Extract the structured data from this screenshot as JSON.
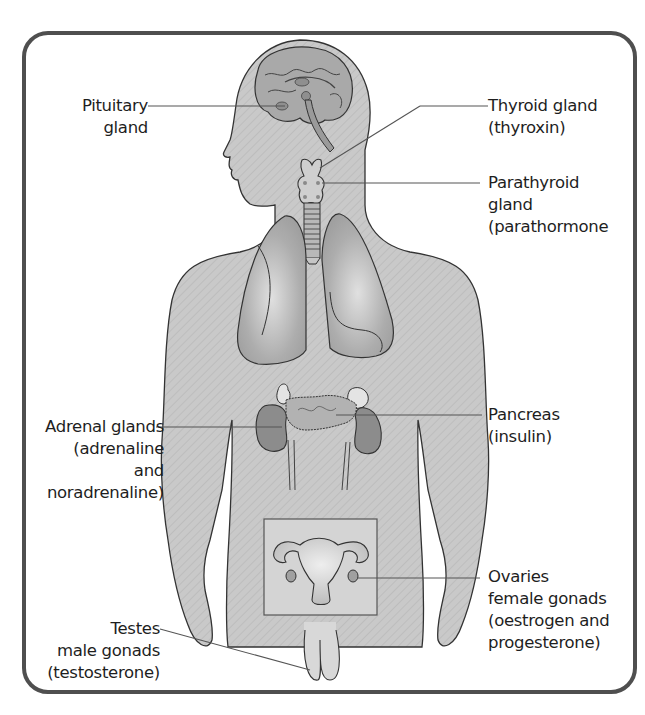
{
  "diagram": {
    "colors": {
      "frame": "#4f4f4f",
      "body_fill": "#c8c8c8",
      "organ_fill": "#a9a9a9",
      "outline": "#333333",
      "leader_line": "#555555",
      "text": "#1e1e1e"
    },
    "labels": {
      "pituitary": {
        "lines": [
          "Pituitary",
          "gland"
        ]
      },
      "thyroid": {
        "lines": [
          "Thyroid gland",
          "(thyroxin)"
        ]
      },
      "parathyroid": {
        "lines": [
          "Parathyroid",
          "gland",
          "(parathormone"
        ]
      },
      "adrenal": {
        "lines": [
          "Adrenal glands",
          "(adrenaline",
          "and",
          "noradrenaline)"
        ]
      },
      "pancreas": {
        "lines": [
          "Pancreas",
          "(insulin)"
        ]
      },
      "ovaries": {
        "lines": [
          "Ovaries",
          "female gonads",
          "(oestrogen and",
          "progesterone)"
        ]
      },
      "testes": {
        "lines": [
          "Testes",
          "male gonads",
          "(testosterone)"
        ]
      }
    }
  }
}
